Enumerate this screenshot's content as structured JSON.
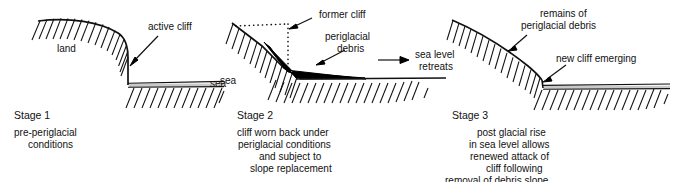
{
  "diagram": {
    "type": "geomorphology-cross-section",
    "panels": [
      {
        "id": "stage-1",
        "stage_label": "Stage 1",
        "caption_lines": [
          "pre-periglacial",
          "conditions"
        ],
        "annotations": [
          {
            "name": "land",
            "text": "land"
          },
          {
            "name": "active-cliff",
            "text": "active cliff"
          },
          {
            "name": "sea",
            "text": "sea"
          }
        ]
      },
      {
        "id": "stage-2",
        "stage_label": "Stage 2",
        "caption_lines": [
          "cliff worn back under",
          "periglacial conditions",
          "and subject to",
          "slope replacement"
        ],
        "annotations": [
          {
            "name": "former-cliff",
            "text": "former cliff"
          },
          {
            "name": "periglacial-debris",
            "text": "periglacial"
          },
          {
            "name": "periglacial-debris-2",
            "text": "debris"
          },
          {
            "name": "sea-level-retreats",
            "text": "sea level"
          },
          {
            "name": "sea-level-retreats-2",
            "text": "retreats"
          },
          {
            "name": "sea",
            "text": "sea"
          }
        ]
      },
      {
        "id": "stage-3",
        "stage_label": "Stage 3",
        "caption_lines": [
          "post glacial rise",
          "in sea level allows",
          "renewed attack of",
          "cliff following",
          "removal of debris slope"
        ],
        "annotations": [
          {
            "name": "remains-of-periglacial-debris",
            "text": "remains of"
          },
          {
            "name": "remains-of-periglacial-debris-2",
            "text": "periglacial debris"
          },
          {
            "name": "new-cliff-emerging",
            "text": "new cliff emerging"
          }
        ]
      }
    ]
  },
  "colors": {
    "ink": "#111111",
    "debris_fill": "#000000",
    "sea_fill": "#c9c9c9",
    "background": "#ffffff"
  }
}
